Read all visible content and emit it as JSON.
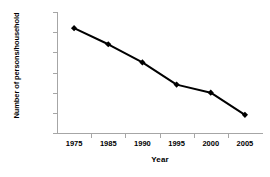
{
  "chart_data": {
    "type": "line",
    "title": "",
    "xlabel": "Year",
    "ylabel": "Number of persons/household",
    "categories": [
      "1975",
      "1985",
      "1990",
      "1995",
      "2000",
      "2005"
    ],
    "values": [
      6.1,
      5.7,
      5.25,
      4.7,
      4.5,
      3.95
    ],
    "series": [
      {
        "name": "Number of persons/household",
        "values": [
          6.1,
          5.7,
          5.25,
          4.7,
          4.5,
          3.95
        ]
      }
    ],
    "ylim": [
      3.5,
      6.5
    ],
    "ytick_labels": [
      "3.50",
      "4.00",
      "4.50",
      "5.00",
      "5.50",
      "6.00",
      "6.50"
    ],
    "ytick_values": [
      3.5,
      4.0,
      4.5,
      5.0,
      5.5,
      6.0,
      6.5
    ],
    "grid": false,
    "legend": false,
    "legend_position": "none",
    "marker": "diamond",
    "line_color": "#000000",
    "marker_color": "#000000",
    "axis_color": "#a6a6a6",
    "background_color": "#ffffff"
  }
}
